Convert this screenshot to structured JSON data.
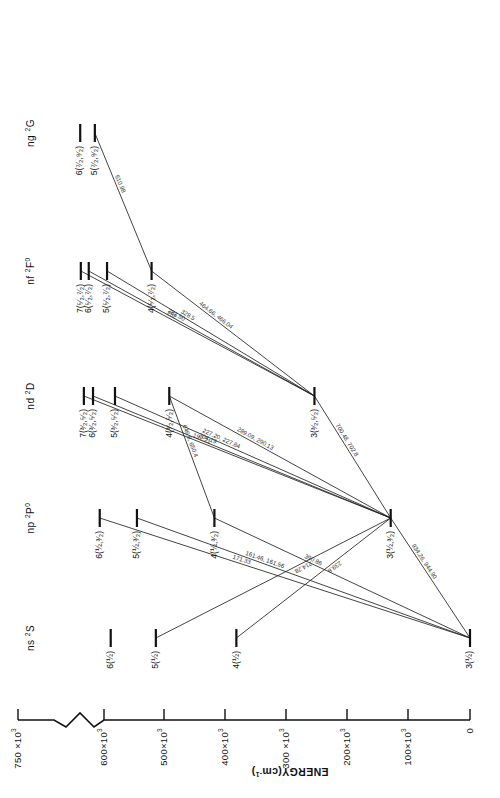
{
  "figure": {
    "kind": "grotrian-energy-level-diagram",
    "orientation_note": "page rotated 90 degrees",
    "axis": {
      "title": "ENERGY(cm",
      "title_sup": "-1",
      "title_tail": ")",
      "ticks": [
        {
          "label": "750 ×10",
          "sup": "3",
          "value": 750
        },
        {
          "label": "600×10",
          "sup": "3",
          "value": 600
        },
        {
          "label": "500×10",
          "sup": "3",
          "value": 500
        },
        {
          "label": "400×10",
          "sup": "3",
          "value": 400
        },
        {
          "label": "300 ×10",
          "sup": "3",
          "value": 300
        },
        {
          "label": "200×10",
          "sup": "3",
          "value": 200
        },
        {
          "label": "100×10",
          "sup": "3",
          "value": 100
        },
        {
          "label": "0",
          "sup": "",
          "value": 0
        }
      ],
      "break_between": [
        750,
        600
      ]
    },
    "columns": [
      {
        "name": "ns",
        "term": "2S",
        "term_pre": "2",
        "term_main": "S",
        "term_post": ""
      },
      {
        "name": "np",
        "term": "2P0",
        "term_pre": "2",
        "term_main": "P",
        "term_post": "0"
      },
      {
        "name": "nd",
        "term": "2D",
        "term_pre": "2",
        "term_main": "D",
        "term_post": ""
      },
      {
        "name": "nf",
        "term": "2F0",
        "term_pre": "2",
        "term_main": "F",
        "term_post": "0"
      },
      {
        "name": "ng",
        "term": "2G",
        "term_pre": "2",
        "term_main": "G",
        "term_post": ""
      }
    ],
    "levels": [
      {
        "col": 0,
        "label": "6(½)",
        "energy": 589
      },
      {
        "col": 0,
        "label": "5(½)",
        "energy": 515
      },
      {
        "col": 0,
        "label": "4(½)",
        "energy": 383
      },
      {
        "col": 0,
        "label": "3(½)",
        "energy": 0
      },
      {
        "col": 1,
        "label": "6(½,³⁄₂)",
        "energy": 607
      },
      {
        "col": 1,
        "label": "5(½,³⁄₂)",
        "energy": 546
      },
      {
        "col": 1,
        "label": "4(½,³⁄₂)",
        "energy": 419
      },
      {
        "col": 1,
        "label": "3(½,³⁄₂)",
        "energy": 130
      },
      {
        "col": 2,
        "label": "7(³⁄₂,⁵⁄₂)",
        "energy": 633
      },
      {
        "col": 2,
        "label": "6(³⁄₂,⁵⁄₂)",
        "energy": 618
      },
      {
        "col": 2,
        "label": "5(³⁄₂,⁵⁄₂)",
        "energy": 582
      },
      {
        "col": 2,
        "label": "4(³⁄₂,⁵⁄₂)",
        "energy": 493
      },
      {
        "col": 2,
        "label": "3(³⁄₂,⁵⁄₂)",
        "energy": 255
      },
      {
        "col": 3,
        "label": "7(⁵⁄₂,⁷⁄₂)",
        "energy": 638
      },
      {
        "col": 3,
        "label": "6(⁵⁄₂,⁷⁄₂)",
        "energy": 625
      },
      {
        "col": 3,
        "label": "5(⁵⁄₂,⁷⁄₂)",
        "energy": 595
      },
      {
        "col": 3,
        "label": "4(⁵⁄₂,⁷⁄₂)",
        "energy": 522
      },
      {
        "col": 4,
        "label": "6(⁷⁄₂,⁹⁄₂)",
        "energy": 639
      },
      {
        "col": 4,
        "label": "5(⁷⁄₂,⁹⁄₂)",
        "energy": 615
      }
    ],
    "transitions": [
      {
        "from": {
          "col": 4,
          "i": 1
        },
        "to": {
          "col": 3,
          "i": 3
        },
        "label": "610.98"
      },
      {
        "from": {
          "col": 3,
          "i": 3
        },
        "to": {
          "col": 2,
          "i": 4
        },
        "label": "464.66, 466.04"
      },
      {
        "from": {
          "col": 3,
          "i": 2
        },
        "to": {
          "col": 2,
          "i": 4
        },
        "label": "328.5"
      },
      {
        "from": {
          "col": 3,
          "i": 1
        },
        "to": {
          "col": 2,
          "i": 4
        },
        "label": "281.50"
      },
      {
        "from": {
          "col": 3,
          "i": 0
        },
        "to": {
          "col": 2,
          "i": 4
        },
        "label": "252"
      },
      {
        "from": {
          "col": 2,
          "i": 0
        },
        "to": {
          "col": 1,
          "i": 3
        },
        "label": "192.21"
      },
      {
        "from": {
          "col": 2,
          "i": 1
        },
        "to": {
          "col": 1,
          "i": 3
        },
        "label": "204.19"
      },
      {
        "from": {
          "col": 2,
          "i": 2
        },
        "to": {
          "col": 1,
          "i": 3
        },
        "label": "227.20, 227.84"
      },
      {
        "from": {
          "col": 2,
          "i": 3
        },
        "to": {
          "col": 1,
          "i": 3
        },
        "label": "289.09, 290.13"
      },
      {
        "from": {
          "col": 2,
          "i": 3
        },
        "to": {
          "col": 1,
          "i": 2
        },
        "label": "646.8, 650.4"
      },
      {
        "from": {
          "col": 1,
          "i": 0
        },
        "to": {
          "col": 0,
          "i": 3
        },
        "label": "171.33"
      },
      {
        "from": {
          "col": 1,
          "i": 1
        },
        "to": {
          "col": 0,
          "i": 3
        },
        "label": "161.46, 161.56"
      },
      {
        "from": {
          "col": 1,
          "i": 2
        },
        "to": {
          "col": 0,
          "i": 3
        },
        "label": "390.86"
      },
      {
        "from": {
          "col": 1,
          "i": 3
        },
        "to": {
          "col": 0,
          "i": 1
        },
        "label": "214.28"
      },
      {
        "from": {
          "col": 1,
          "i": 3
        },
        "to": {
          "col": 0,
          "i": 2
        },
        "label": "239.8"
      },
      {
        "from": {
          "col": 2,
          "i": 4
        },
        "to": {
          "col": 1,
          "i": 3
        },
        "label": "700.48, 702.8"
      },
      {
        "from": {
          "col": 1,
          "i": 3
        },
        "to": {
          "col": 0,
          "i": 3
        },
        "label": "934.26, 944.90"
      }
    ]
  }
}
